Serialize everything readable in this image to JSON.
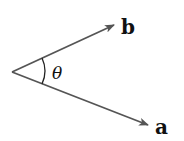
{
  "diagram": {
    "origin": [
      12,
      72
    ],
    "vectors": [
      {
        "name": "b",
        "label": "b",
        "tip": [
          116,
          24
        ],
        "color": "#555555"
      },
      {
        "name": "a",
        "label": "a",
        "tip": [
          150,
          126
        ],
        "color": "#555555"
      }
    ],
    "angle_label": "θ"
  }
}
